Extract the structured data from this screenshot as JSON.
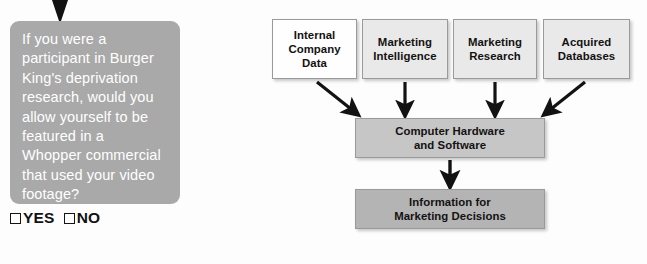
{
  "survey": {
    "pointer_icon": "down-triangle-pointer-icon",
    "question": "If you were a\nparticipant in Burger\nKing's deprivation\nresearch, would you\nallow yourself to be\nfeatured in a\nWhopper commercial\nthat used your video\nfootage?",
    "options": [
      {
        "label": "YES",
        "checked": false
      },
      {
        "label": "NO",
        "checked": false
      }
    ],
    "bubble_color": "#a9a9a9",
    "text_color": "#ffffff"
  },
  "diagram": {
    "type": "flow",
    "sources": [
      {
        "label": "Internal\nCompany\nData",
        "fill": "#fefefe"
      },
      {
        "label": "Marketing\nIntelligence",
        "fill": "#e9e9e9"
      },
      {
        "label": "Marketing\nResearch",
        "fill": "#e9e9e9"
      },
      {
        "label": "Acquired\nDatabases",
        "fill": "#e9e9e9"
      }
    ],
    "process": {
      "label": "Computer Hardware\nand Software",
      "fill": "#c6c6c6"
    },
    "output": {
      "label": "Information for\nMarketing Decisions",
      "fill": "#b4b4b4"
    },
    "arrow_color": "#121212"
  }
}
